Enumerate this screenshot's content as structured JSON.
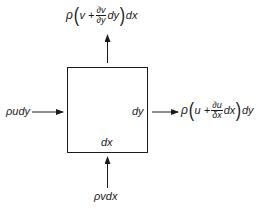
{
  "diagram": {
    "type": "control-volume-mass-flux",
    "stroke_color": "#1a1a1a",
    "box": {
      "x": 67,
      "y": 67,
      "width": 80,
      "height": 85
    },
    "labels": {
      "inside_right": "dy",
      "inside_bottom": "dx"
    },
    "fluxes": {
      "left_in": {
        "text": "ρudy",
        "direction": "right"
      },
      "bottom_in": {
        "text": "ρvdx",
        "direction": "up"
      },
      "top_out": {
        "rho": "ρ",
        "open": "(",
        "term": "v +",
        "frac_num": "∂v",
        "frac_den": "∂y",
        "after_frac": "dy",
        "close": ")",
        "suffix": "dx",
        "direction": "up"
      },
      "right_out": {
        "rho": "ρ",
        "open": "(",
        "term": "u +",
        "frac_num": "∂u",
        "frac_den": "δx",
        "after_frac": "dx",
        "close": ")",
        "suffix": "dy",
        "direction": "right"
      }
    }
  }
}
